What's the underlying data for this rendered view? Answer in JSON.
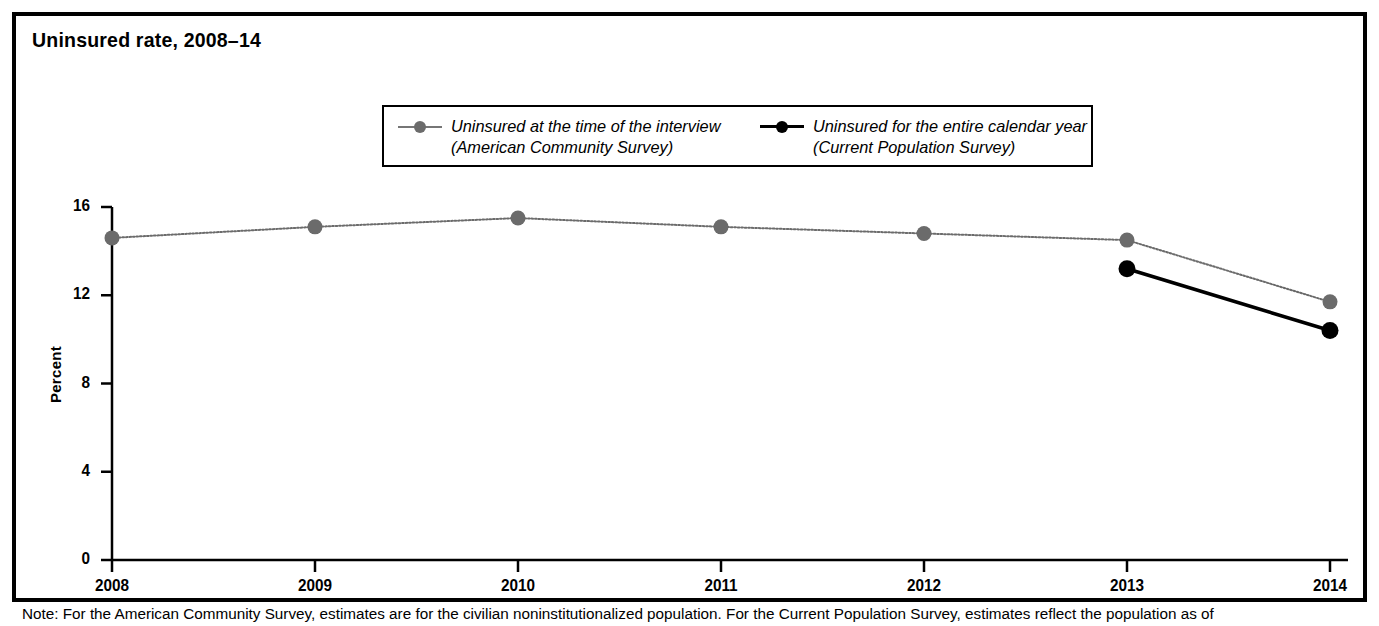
{
  "figure": {
    "title": "Uninsured rate, 2008–14",
    "note": "Note: For the American Community Survey, estimates are for the civilian noninstitutionalized population. For the Current Population Survey, estimates reflect the population as of"
  },
  "legend": {
    "entries": [
      {
        "marker": "gray-circle-line-marker",
        "line1": "Uninsured at the time of the interview",
        "line2": "(American Community Survey)",
        "color": "#6b6b6b"
      },
      {
        "marker": "black-circle-line-marker",
        "line1": "Uninsured for the entire calendar year",
        "line2": "(Current Population Survey)",
        "color": "#000000"
      }
    ]
  },
  "axes": {
    "ylabel": "Percent",
    "yticks": [
      "0",
      "4",
      "8",
      "12",
      "16"
    ],
    "xticks": [
      "2008",
      "2009",
      "2010",
      "2011",
      "2012",
      "2013",
      "2014"
    ]
  },
  "chart_data": {
    "type": "line",
    "title": "Uninsured rate, 2008–14",
    "xlabel": "",
    "ylabel": "Percent",
    "x": [
      2008,
      2009,
      2010,
      2011,
      2012,
      2013,
      2014
    ],
    "xlim": [
      2008,
      2014
    ],
    "ylim": [
      0,
      16
    ],
    "yticks": [
      0,
      4,
      8,
      12,
      16
    ],
    "grid": false,
    "legend_position": "top-center",
    "series": [
      {
        "name": "Uninsured at the time of the interview (American Community Survey)",
        "color": "#6b6b6b",
        "linestyle": "dotted",
        "x": [
          2008,
          2009,
          2010,
          2011,
          2012,
          2013,
          2014
        ],
        "values": [
          14.6,
          15.1,
          15.5,
          15.1,
          14.8,
          14.5,
          11.7
        ]
      },
      {
        "name": "Uninsured for the entire calendar year (Current Population Survey)",
        "color": "#000000",
        "linestyle": "solid",
        "x": [
          2013,
          2014
        ],
        "values": [
          13.2,
          10.4
        ]
      }
    ]
  }
}
